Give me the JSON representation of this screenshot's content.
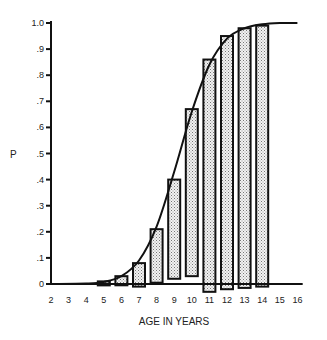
{
  "chart_data": {
    "type": "bar",
    "title": "",
    "xlabel": "AGE IN YEARS",
    "ylabel": "P",
    "xlim": [
      2,
      16
    ],
    "ylim": [
      0,
      1.0
    ],
    "x_ticks": [
      "2",
      "3",
      "4",
      "5",
      "6",
      "7",
      "8",
      "9",
      "10",
      "11",
      "12",
      "13",
      "14",
      "15",
      "16"
    ],
    "y_ticks": [
      "0",
      ".1",
      ".2",
      ".3",
      ".4",
      ".5",
      ".6",
      ".7",
      ".8",
      ".9",
      "1.0"
    ],
    "grid": false,
    "legend": null,
    "bars": {
      "description": "Stippled floating bars per age showing range (lower, upper) of proportion P",
      "categories": [
        "5",
        "6",
        "7",
        "8",
        "9",
        "10",
        "11",
        "12",
        "13",
        "14"
      ],
      "upper": [
        0.01,
        0.03,
        0.08,
        0.21,
        0.4,
        0.67,
        0.86,
        0.95,
        0.98,
        0.99
      ],
      "lower": [
        0.0,
        -0.005,
        -0.01,
        0.005,
        0.02,
        0.03,
        -0.03,
        -0.02,
        -0.015,
        -0.01
      ]
    },
    "curve": {
      "description": "Smooth sigmoid (logistic) fit of P vs age",
      "x": [
        2,
        4,
        5,
        6,
        7,
        8,
        9,
        10,
        11,
        12,
        13,
        14,
        15,
        16
      ],
      "y": [
        0.0,
        0.002,
        0.008,
        0.03,
        0.09,
        0.22,
        0.43,
        0.66,
        0.84,
        0.94,
        0.98,
        0.995,
        1.0,
        1.0
      ]
    }
  }
}
